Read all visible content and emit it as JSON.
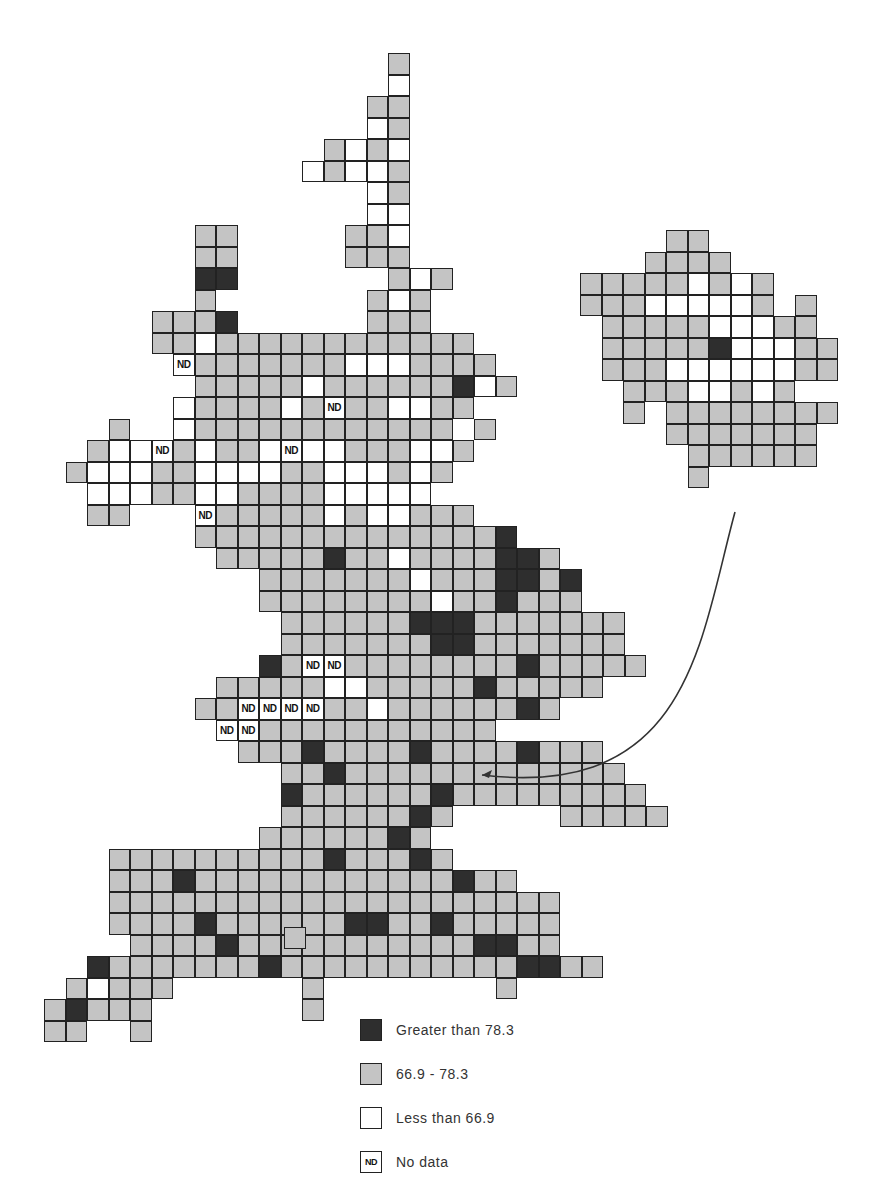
{
  "map": {
    "cell_size": 21.5,
    "main": {
      "origin_x": 44,
      "origin_y": 53,
      "rows": [
        "................g........",
        "................w........",
        "...............gg........",
        "...............wg........",
        ".............gwgw........",
        "............wgwwg........",
        "...............wg........",
        "...............ww........",
        ".......gg.....ggw........",
        ".......gg.....ggg........",
        ".......dd.......gwg......",
        ".......g.......gwg.......",
        ".....gggd......ggg.......",
        ".....ggwgggggggggggg.....",
        "......ngggggggwwwgggg....",
        ".......gggggwggggggdwg...",
        "......wggggwgnggwwgg.....",
        "...g..wgggggggggggg.g....",
        "..gwwngwggwnwwgggwwg.....",
        ".gwwwggwwwwggwwwgwg......",
        "..wwwggwwggggwwwww.......",
        "..gg...ngggggwgwwggg.....",
        ".......ggggggggggggggd...",
        "........gggggdggwggggddg.",
        "..........gggggggwgggddgd",
        "..........ggggggggwggdggg",
        "...........ggggggdddggggggg",
        "...........gggggggddggggggg",
        "..........dgnnggggggggdggggg",
        "........gggggwwgggggdggggg",
        ".......ggnnnnggwggggggdg",
        "........nnggggggggggg",
        ".........gggdggggdggggdggg",
        "...........ggdggggggggggggg",
        "...........dggggggdggggggggg",
        "...........ggggggdg.....ggggg",
        "..........ggggggdg",
        "...ggggggggggdgggdg",
        "...gggdggggggggggggdgg",
        "...ggggggggggggggggggggg",
        "...ggggdggggggddggdggggg",
        "....ggggdgggggggggggddgg",
        "..dgggggggdgggggggggggddgg",
        ".gwggg......g........g",
        "gdggg.......g",
        "gg..g"
      ]
    },
    "inset": {
      "origin_x": 580,
      "origin_y": 230,
      "rows": [
        "....gg......",
        "...gggg.....",
        "gggggwgwg...",
        "gggwwwwwg.g.",
        ".gggggwwwgg.",
        ".gggggdwwwgg",
        ".gggwwwwwwgg",
        "..gggwwgwg..",
        "..g.gggggggg",
        "....ggggggg.",
        ".....gggggg.",
        ".....g......"
      ]
    },
    "isolated_cells": [
      {
        "x": 284,
        "y": 927,
        "type": "g"
      }
    ],
    "arrow": {
      "from": [
        735,
        512
      ],
      "to": [
        480,
        775
      ]
    }
  },
  "legend": {
    "items": [
      {
        "swatch": "d",
        "swatch_text": "",
        "label": "Greater than 78.3"
      },
      {
        "swatch": "g",
        "swatch_text": "",
        "label": "66.9 - 78.3"
      },
      {
        "swatch": "w",
        "swatch_text": "",
        "label": "Less than 66.9"
      },
      {
        "swatch": "n",
        "swatch_text": "ND",
        "label": "No data"
      }
    ]
  },
  "nd_label": "ND",
  "colors": {
    "greater": "#2e2e2e",
    "middle": "#c4c4c4",
    "less": "#ffffff",
    "border": "#222222"
  }
}
